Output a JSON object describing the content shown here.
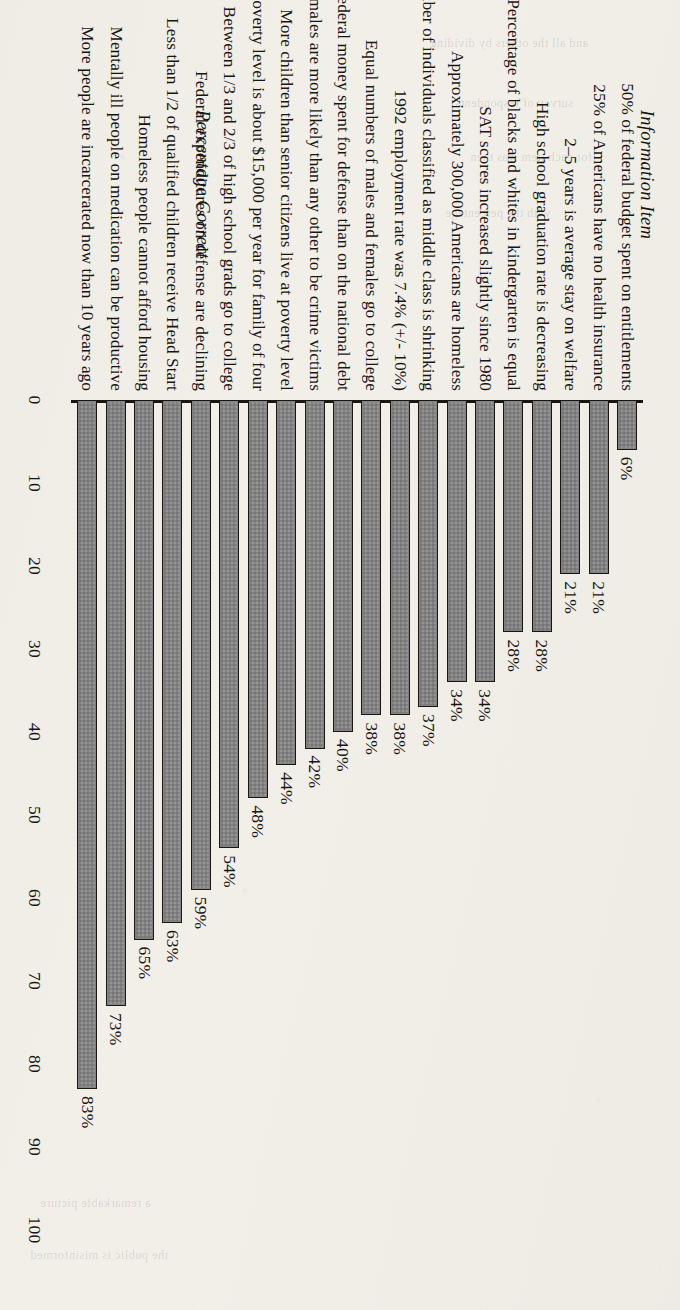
{
  "chart_data": {
    "type": "bar",
    "orientation": "horizontal",
    "title": "",
    "xlabel": "Percentage Correct",
    "ylabel": "Information Item",
    "xlim": [
      0,
      100
    ],
    "grid": false,
    "legend": null,
    "tick_labels": [
      "0",
      "10",
      "20",
      "30",
      "40",
      "50",
      "60",
      "70",
      "80",
      "90",
      "100"
    ],
    "categories": [
      "50% of federal budget spent on entitlements",
      "25% of Americans have no health insurance",
      "2–5 years is average stay on welfare",
      "High school graduation rate is decreasing",
      "Percentage of blacks and whites in kindergarten is equal",
      "SAT scores increased slightly since 1980",
      "Approximately 300,000 Americans are homeless",
      "Number of individuals classified as middle class is shrinking",
      "1992 employment rate was 7.4% (+/- 10%)",
      "Equal numbers of males and females go to college",
      "More federal money spent for defense than on the national debt",
      "Black males are more likely than any other to be crime victims",
      "More children than senior citizens live at poverty level",
      "Poverty level is about $15,000 per year for family of four",
      "Between 1/3 and 2/3 of high school grads go to college",
      "Federal expenditures on defense are declining",
      "Less than 1/2 of qualified children receive Head Start",
      "Homeless people cannot afford housing",
      "Mentally ill people on medication can be productive",
      "More people are incarcerated now than 10 years ago"
    ],
    "values": [
      6,
      21,
      21,
      28,
      28,
      34,
      34,
      37,
      38,
      38,
      40,
      42,
      44,
      48,
      54,
      59,
      63,
      65,
      73,
      83
    ],
    "value_labels": [
      "6%",
      "21%",
      "21%",
      "28%",
      "28%",
      "34%",
      "34%",
      "37%",
      "38%",
      "38%",
      "40%",
      "42%",
      "44%",
      "48%",
      "54%",
      "59%",
      "63%",
      "65%",
      "73%",
      "83%"
    ],
    "colors": {
      "bar_fill": "#808080",
      "bar_stroke": "#17140f",
      "page_background": "#f2efe9",
      "text": "#141210"
    }
  },
  "bleed_text": {
    "lines": [
      "and all the others by dividing",
      "survey of respondents",
      "for each item was then",
      "with the percentage",
      "a remarkable picture",
      "the public is misinformed"
    ]
  }
}
